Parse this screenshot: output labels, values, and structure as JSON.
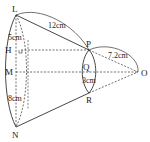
{
  "diagram": {
    "type": "frustum-of-cone",
    "points": {
      "L": "L",
      "N": "N",
      "P": "P",
      "R": "R",
      "O": "O",
      "H": "H",
      "M": "M",
      "Q": "Q"
    },
    "measurements": {
      "LP": "12cm",
      "LH": "5cm",
      "PO": "7.2cm",
      "QR": "3cm",
      "MN": "8cm"
    },
    "colors": {
      "stroke": "#333333",
      "text": "#222222",
      "background": "#ffffff"
    }
  }
}
